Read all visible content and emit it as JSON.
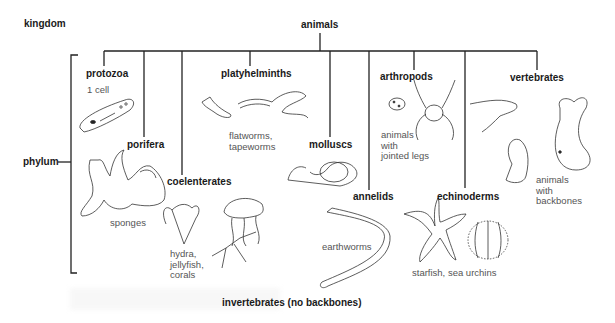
{
  "diagram": {
    "axis_labels": {
      "kingdom": "kingdom",
      "phylum": "phylum"
    },
    "root": {
      "label": "animals"
    },
    "phyla": [
      {
        "name": "protozoa",
        "desc": "1 cell",
        "icon": "paramecium-icon"
      },
      {
        "name": "porifera",
        "desc": "sponges",
        "icon": "sponge-icon"
      },
      {
        "name": "coelenterates",
        "desc": "hydra,\njellyfish,\ncorals",
        "icon": "jellyfish-icon"
      },
      {
        "name": "platyhelminths",
        "desc": "flatworms,\ntapeworms",
        "icon": "flatworm-icon"
      },
      {
        "name": "molluscs",
        "desc": "",
        "icon": "snail-icon"
      },
      {
        "name": "annelids",
        "desc": "earthworms",
        "icon": "earthworm-icon"
      },
      {
        "name": "arthropods",
        "desc": "animals\nwith\njointed legs",
        "icon": "spider-icon"
      },
      {
        "name": "echinoderms",
        "desc": "starfish, sea urchins",
        "icon": "starfish-icon"
      },
      {
        "name": "vertebrates",
        "desc": "animals\nwith\nbackbones",
        "icon": "whale-icon"
      }
    ],
    "group_caption": "invertebrates (no backbones)",
    "colors": {
      "line": "#222222",
      "text": "#1a1a1a",
      "desc_text": "#555555"
    }
  }
}
